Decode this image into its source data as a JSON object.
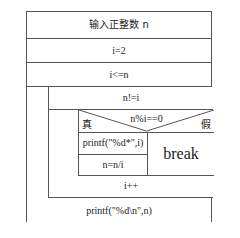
{
  "diagram": {
    "type": "nassi-shneiderman",
    "steps": {
      "input": "输入正整数 n",
      "init": "i=2",
      "outer_loop_condition": "i<=n",
      "inner_loop_condition": "n!=i",
      "decision_condition": "n%i==0",
      "decision_true_label": "真",
      "decision_false_label": "假",
      "true_branch": {
        "print_factor": "printf(\"%d*\",i)",
        "divide": "n=n/i"
      },
      "false_branch": {
        "break": "break"
      },
      "increment": "i++",
      "final_output": "printf(\"%d\\n\",n)"
    }
  },
  "style": {
    "line_color": "#555555",
    "background": "#ffffff",
    "text_color": "#1a1a1a"
  }
}
